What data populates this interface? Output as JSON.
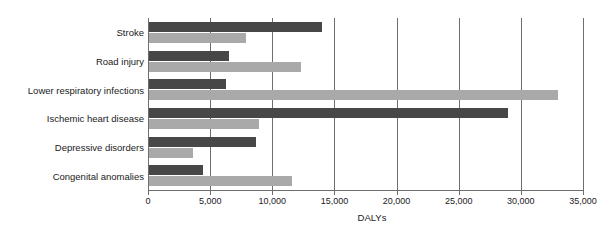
{
  "chart_data": {
    "type": "bar",
    "orientation": "horizontal",
    "grouped": true,
    "title": "",
    "xlabel": "DALYs",
    "ylabel": "",
    "xlim": [
      0,
      35000
    ],
    "xticks": [
      0,
      5000,
      10000,
      15000,
      20000,
      25000,
      30000,
      35000
    ],
    "xtick_labels": [
      "0",
      "5,000",
      "10,000",
      "15,000",
      "20,000",
      "25,000",
      "30,000",
      "35,000"
    ],
    "grid": "vertical",
    "legend": "none",
    "categories": [
      "Stroke",
      "Road injury",
      "Lower respiratory infections",
      "Ischemic heart disease",
      "Depressive disorders",
      "Congenital anomalies"
    ],
    "series": [
      {
        "name": "series-dark",
        "color": "#474747",
        "values": [
          14000,
          6500,
          6300,
          29000,
          8700,
          4400
        ]
      },
      {
        "name": "series-light",
        "color": "#a9a9a9",
        "values": [
          7900,
          12300,
          33000,
          8900,
          3600,
          11600
        ]
      }
    ]
  },
  "axis": {
    "x_title": "DALYs"
  },
  "colors": {
    "series_dark": "#474747",
    "series_light": "#a9a9a9",
    "axis": "#6e6e6e",
    "text": "#1a1a1a",
    "background": "#ffffff"
  }
}
